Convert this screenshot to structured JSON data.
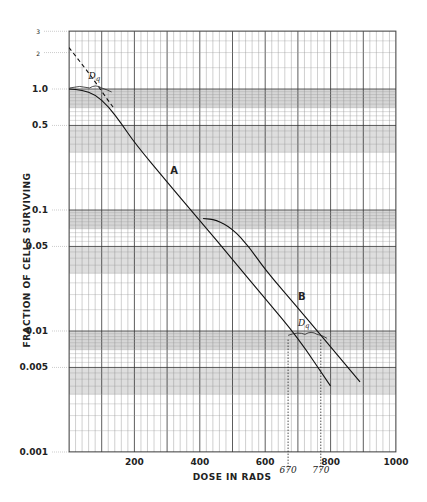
{
  "chart_data": {
    "type": "line",
    "title": "",
    "xlabel": "DOSE IN RADS",
    "ylabel": "FRACTION OF CELLS SURVIVING",
    "xscale": "linear",
    "yscale": "log",
    "xlim": [
      0,
      1000
    ],
    "ylim": [
      0.001,
      3
    ],
    "x_ticks": [
      200,
      400,
      600,
      800,
      1000
    ],
    "x_tick_labels": [
      "200",
      "400",
      "600",
      "800",
      "1000"
    ],
    "y_ticks": [
      3,
      2,
      1.0,
      0.5,
      0.1,
      0.05,
      0.01,
      0.005,
      0.001
    ],
    "y_tick_labels": [
      "3",
      "2",
      "1.0",
      "0.5",
      "0.1",
      "0.05",
      "0.01",
      "0.005",
      "0.001"
    ],
    "grid": true,
    "legend": null,
    "series": [
      {
        "name": "A",
        "style": "solid",
        "points": [
          [
            0,
            1.0
          ],
          [
            40,
            0.98
          ],
          [
            80,
            0.9
          ],
          [
            120,
            0.72
          ],
          [
            160,
            0.52
          ],
          [
            200,
            0.36
          ],
          [
            300,
            0.17
          ],
          [
            400,
            0.082
          ],
          [
            500,
            0.039
          ],
          [
            600,
            0.0185
          ],
          [
            700,
            0.0088
          ],
          [
            800,
            0.0035
          ]
        ]
      },
      {
        "name": "A extrapolation",
        "style": "dashed",
        "points": [
          [
            0,
            2.2
          ],
          [
            40,
            1.6
          ],
          [
            80,
            1.15
          ],
          [
            120,
            0.8
          ],
          [
            140,
            0.68
          ]
        ]
      },
      {
        "name": "B",
        "style": "solid",
        "points": [
          [
            410,
            0.085
          ],
          [
            450,
            0.083
          ],
          [
            500,
            0.07
          ],
          [
            550,
            0.05
          ],
          [
            600,
            0.032
          ],
          [
            700,
            0.0155
          ],
          [
            800,
            0.0074
          ],
          [
            890,
            0.0038
          ]
        ]
      }
    ],
    "annotations": [
      {
        "text": "A",
        "x": 310,
        "y": 0.2
      },
      {
        "text": "B",
        "x": 700,
        "y": 0.018
      },
      {
        "text": "Dq",
        "x": 60,
        "y": 1.2,
        "note": "shoulder width of curve A"
      },
      {
        "text": "Dq",
        "x": 700,
        "y": 0.011,
        "note": "shoulder width between curves A and B"
      },
      {
        "text": "670",
        "x": 670,
        "y": 0.001,
        "note": "dotted vertical marker"
      },
      {
        "text": "770",
        "x": 770,
        "y": 0.001,
        "note": "dotted vertical marker"
      }
    ]
  }
}
